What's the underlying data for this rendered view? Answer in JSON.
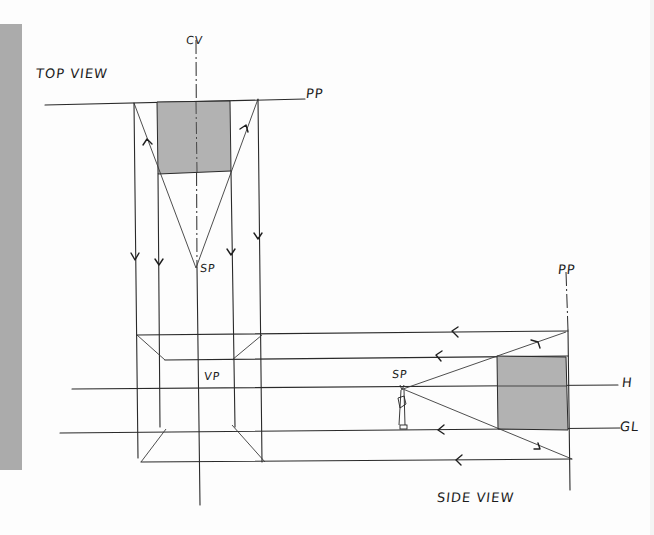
{
  "diagram": {
    "labels": {
      "top_view": "TOP VIEW",
      "side_view": "SIDE VIEW",
      "cv": "CV",
      "pp_top": "PP",
      "pp_side": "PP",
      "sp_top": "SP",
      "sp_side": "SP",
      "vp": "VP",
      "h": "H",
      "gl": "GL"
    },
    "colors": {
      "ink": "#2a2a2a",
      "shaded_object": "#b2b2b2",
      "side_tab": "#ababab",
      "paper": "#fdfdfd"
    },
    "elements": [
      {
        "name": "picture-plane-top",
        "label": "PP"
      },
      {
        "name": "center-of-vision",
        "label": "CV"
      },
      {
        "name": "station-point-top",
        "label": "SP"
      },
      {
        "name": "picture-plane-side",
        "label": "PP"
      },
      {
        "name": "station-point-side",
        "label": "SP"
      },
      {
        "name": "horizon-line",
        "label": "H"
      },
      {
        "name": "ground-line",
        "label": "GL"
      },
      {
        "name": "vanishing-point",
        "label": "VP"
      }
    ]
  }
}
